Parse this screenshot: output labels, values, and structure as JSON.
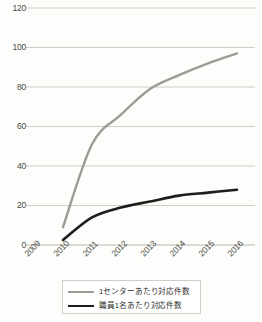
{
  "chart_data": {
    "type": "line",
    "title": "",
    "xlabel": "",
    "ylabel": "",
    "x": [
      "2009",
      "2010",
      "2011",
      "2012",
      "2013",
      "2014",
      "2015",
      "2016"
    ],
    "categories": [
      "2009",
      "2010",
      "2011",
      "2012",
      "2013",
      "2014",
      "2015",
      "2016"
    ],
    "ylim": [
      0,
      120
    ],
    "yticks": [
      0,
      20,
      40,
      60,
      80,
      100,
      120
    ],
    "ytick_labels": [
      "0",
      "20",
      "40",
      "60",
      "80",
      "100",
      "120"
    ],
    "grid": true,
    "grid_axis": "y",
    "legend_position": "bottom",
    "series": [
      {
        "name": "1センターあたり対応件数",
        "color": "#9c9c93",
        "values": [
          null,
          9,
          51,
          66,
          79,
          86,
          92,
          97
        ]
      },
      {
        "name": "職員1名あたり対応件数",
        "color": "#1d1d1b",
        "values": [
          null,
          2.5,
          14,
          19,
          22,
          25,
          26.5,
          28
        ]
      }
    ]
  },
  "legend": {
    "items": [
      {
        "label": "1センターあたり対応件数"
      },
      {
        "label": "職員1名あたり対応件数"
      }
    ]
  }
}
